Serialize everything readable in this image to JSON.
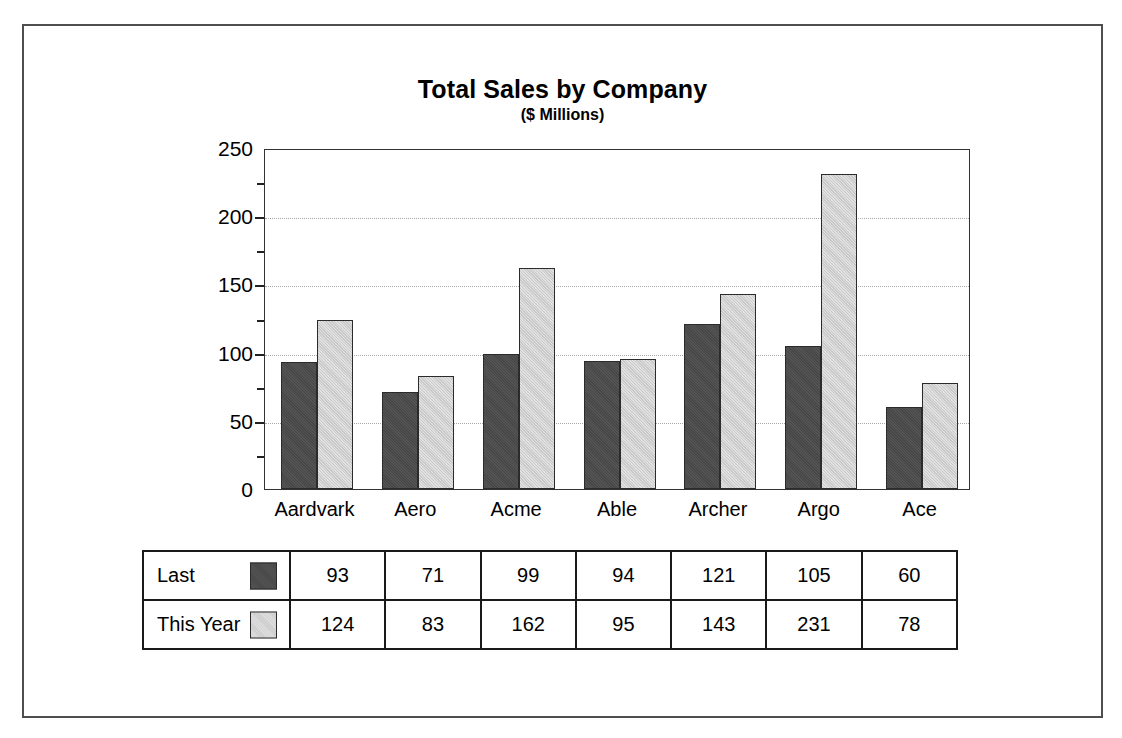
{
  "chart_data": {
    "type": "bar",
    "title": "Total Sales by Company",
    "subtitle": "($ Millions)",
    "xlabel": "",
    "ylabel": "",
    "ylim": [
      0,
      250
    ],
    "ytick_step": 50,
    "yminor_step": 25,
    "grid": true,
    "legend_position": "table-row-heads",
    "categories": [
      "Aardvark",
      "Aero",
      "Acme",
      "Able",
      "Archer",
      "Argo",
      "Ace"
    ],
    "yticks": [
      "0",
      "50",
      "100",
      "150",
      "200",
      "250"
    ],
    "series": [
      {
        "name": "Last",
        "color": "#474747",
        "values": [
          93,
          71,
          99,
          94,
          121,
          105,
          60
        ]
      },
      {
        "name": "This Year",
        "color": "#c9c9c9",
        "values": [
          124,
          83,
          162,
          95,
          143,
          231,
          78
        ]
      }
    ]
  },
  "table": {
    "rows": [
      {
        "label": "Last",
        "swatch": "dark-swatch",
        "cells": [
          "93",
          "71",
          "99",
          "94",
          "121",
          "105",
          "60"
        ]
      },
      {
        "label": "This Year",
        "swatch": "light-swatch",
        "cells": [
          "124",
          "83",
          "162",
          "95",
          "143",
          "231",
          "78"
        ]
      }
    ]
  },
  "colors": {
    "series_last": "#474747",
    "series_this_year": "#c9c9c9",
    "frame": "#4e4e4e",
    "axis": "#333333",
    "gridline": "#a8a8a8",
    "background": "#ffffff"
  }
}
